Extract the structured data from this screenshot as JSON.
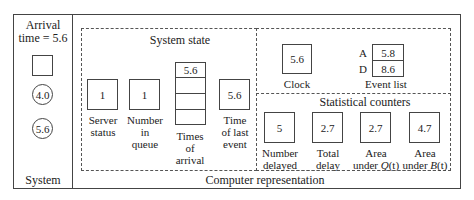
{
  "system": {
    "title": "System",
    "arrival_label": "Arrival",
    "arrival_time": "time = 5.6",
    "server_box": "",
    "queue_customers": [
      "4.0",
      "5.6"
    ]
  },
  "computer": {
    "title": "Computer representation",
    "system_state": {
      "title": "System state",
      "server_status": {
        "value": "1",
        "label_1": "Server",
        "label_2": "status"
      },
      "number_in_queue": {
        "value": "1",
        "label_1": "Number",
        "label_2": "in",
        "label_3": "queue"
      },
      "times_of_arrival": {
        "values": [
          "5.6",
          "",
          "",
          ""
        ],
        "label_1": "Times",
        "label_2": "of",
        "label_3": "arrival"
      },
      "time_of_last_event": {
        "value": "5.6",
        "label_1": "Time",
        "label_2": "of last",
        "label_3": "event"
      }
    },
    "clock": {
      "value": "5.6",
      "label": "Clock"
    },
    "event_list": {
      "label": "Event list",
      "entries": [
        {
          "key": "A",
          "value": "5.8"
        },
        {
          "key": "D",
          "value": "8.6"
        }
      ]
    },
    "statistical_counters": {
      "title": "Statistical counters",
      "number_delayed": {
        "value": "5",
        "label_1": "Number",
        "label_2": "delayed"
      },
      "total_delay": {
        "value": "2.7",
        "label_1": "Total",
        "label_2": "delay"
      },
      "area_q": {
        "value": "2.7",
        "label_1": "Area",
        "label_2a": "under ",
        "label_2b": "Q",
        "label_2c": "(t)"
      },
      "area_b": {
        "value": "4.7",
        "label_1": "Area",
        "label_2a": "under ",
        "label_2b": "B",
        "label_2c": "(t)"
      }
    }
  }
}
